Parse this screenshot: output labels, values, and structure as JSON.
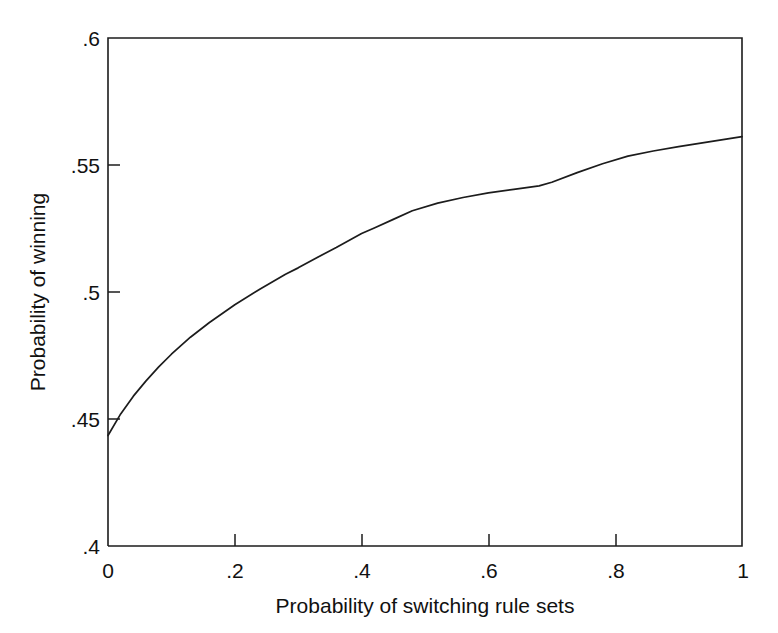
{
  "chart_data": {
    "type": "line",
    "title": "",
    "xlabel": "Probability of switching rule sets",
    "ylabel": "Probability of winning",
    "xlim": [
      0,
      1
    ],
    "ylim": [
      0.4,
      0.6
    ],
    "grid": false,
    "legend": null,
    "xticks": [
      0,
      0.2,
      0.4,
      0.6,
      0.8,
      1
    ],
    "xticklabels": [
      "0",
      ".2",
      ".4",
      ".6",
      ".8",
      "1"
    ],
    "yticks": [
      0.4,
      0.45,
      0.5,
      0.55,
      0.6
    ],
    "yticklabels": [
      ".4",
      ".45",
      ".5",
      ".55",
      ".6"
    ],
    "series": [
      {
        "name": "Probability of winning",
        "color": "#1c1c1c",
        "x": [
          0.0,
          0.02,
          0.04,
          0.06,
          0.08,
          0.1,
          0.13,
          0.16,
          0.2,
          0.24,
          0.28,
          0.3,
          0.33,
          0.36,
          0.4,
          0.42,
          0.45,
          0.48,
          0.52,
          0.56,
          0.6,
          0.64,
          0.68,
          0.7,
          0.74,
          0.78,
          0.82,
          0.86,
          0.9,
          0.94,
          0.97,
          1.0
        ],
        "y": [
          0.4435,
          0.452,
          0.459,
          0.465,
          0.4705,
          0.4755,
          0.4822,
          0.488,
          0.495,
          0.5012,
          0.507,
          0.5095,
          0.5136,
          0.5175,
          0.523,
          0.5252,
          0.5286,
          0.532,
          0.535,
          0.5372,
          0.539,
          0.5404,
          0.5418,
          0.5432,
          0.547,
          0.5505,
          0.5535,
          0.5555,
          0.5572,
          0.5588,
          0.56,
          0.5612
        ]
      }
    ],
    "curve_points_readable": {
      "at_x_0": 0.443,
      "at_x_0.2": 0.507,
      "at_x_0.4": 0.537,
      "at_x_0.6": 0.56,
      "at_x_0.8": 0.574,
      "at_x_1.0": 0.586
    }
  },
  "axes": {
    "x_title": "Probability of switching rule sets",
    "y_title": "Probability of winning",
    "x_tick_labels": [
      "0",
      ".2",
      ".4",
      ".6",
      ".8",
      "1"
    ],
    "y_tick_labels": [
      ".4",
      ".45",
      ".5",
      ".55",
      ".6"
    ]
  },
  "colors": {
    "curve": "#1c1c1c",
    "axis": "#1c1c1c",
    "background": "#ffffff"
  }
}
